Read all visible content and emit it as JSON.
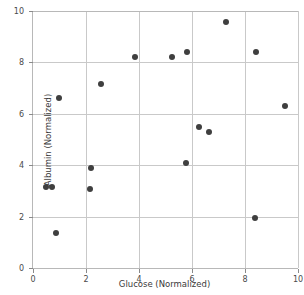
{
  "chart_data": {
    "type": "scatter",
    "title": "",
    "xlabel": "Glucose (Normalized)",
    "ylabel": "Albumin (Normalized)",
    "xlim": [
      0,
      10
    ],
    "ylim": [
      0,
      10
    ],
    "xticks": [
      "0",
      "2",
      "4",
      "6",
      "8",
      "10"
    ],
    "xtick_values": [
      0,
      2,
      4,
      6,
      8,
      10
    ],
    "yticks": [
      "0",
      "2",
      "4",
      "6",
      "8",
      "10"
    ],
    "ytick_values": [
      0,
      2,
      4,
      6,
      8,
      10
    ],
    "grid": true,
    "legend": "none",
    "marker_color": "#3f3f3f",
    "marker_size": 6,
    "series": [
      {
        "name": "samples",
        "points": [
          {
            "x": 0.49,
            "y": 3.15
          },
          {
            "x": 0.72,
            "y": 3.15
          },
          {
            "x": 0.87,
            "y": 1.36
          },
          {
            "x": 0.98,
            "y": 6.61
          },
          {
            "x": 2.15,
            "y": 3.07
          },
          {
            "x": 2.19,
            "y": 3.89
          },
          {
            "x": 2.57,
            "y": 7.16
          },
          {
            "x": 3.85,
            "y": 8.21
          },
          {
            "x": 5.25,
            "y": 8.21
          },
          {
            "x": 5.77,
            "y": 4.09
          },
          {
            "x": 5.81,
            "y": 8.4
          },
          {
            "x": 6.26,
            "y": 5.49
          },
          {
            "x": 6.64,
            "y": 5.29
          },
          {
            "x": 7.28,
            "y": 9.57
          },
          {
            "x": 8.38,
            "y": 1.95
          },
          {
            "x": 8.42,
            "y": 8.4
          },
          {
            "x": 9.51,
            "y": 6.3
          }
        ]
      }
    ]
  }
}
